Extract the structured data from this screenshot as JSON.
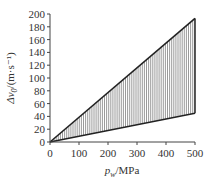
{
  "chart_data": {
    "type": "area",
    "title": "",
    "xlabel": "p_w/MPa",
    "xlabel_parts": {
      "var": "p",
      "sub": "w",
      "unit": "/MPa"
    },
    "ylabel": "Δv0/(m·s⁻¹)",
    "ylabel_parts": {
      "var": "Δv",
      "sub": "0",
      "unit": "/(m·s⁻¹)"
    },
    "xlim": [
      0,
      500
    ],
    "ylim": [
      0,
      200
    ],
    "xticks": [
      0,
      100,
      200,
      300,
      400,
      500
    ],
    "yticks": [
      0,
      20,
      40,
      60,
      80,
      100,
      120,
      140,
      160,
      180,
      200
    ],
    "grid": false,
    "legend": null,
    "series": [
      {
        "name": "upper bound",
        "x": [
          0,
          500
        ],
        "values": [
          0,
          193
        ]
      },
      {
        "name": "lower bound",
        "x": [
          0,
          500
        ],
        "values": [
          0,
          45
        ]
      }
    ],
    "fill": "vertical hatching between upper and lower bounds",
    "colors": {
      "line": "#222222",
      "hatch": "#555555",
      "axis": "#444444"
    }
  }
}
